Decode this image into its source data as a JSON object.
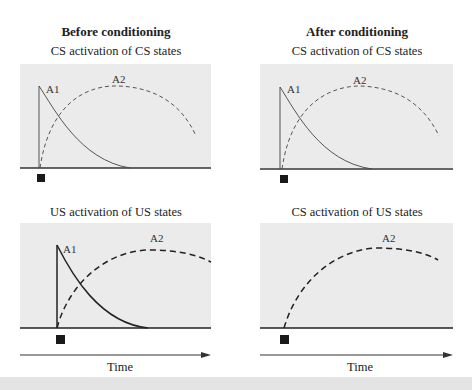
{
  "columns": [
    {
      "title": "Before conditioning"
    },
    {
      "title": "After conditioning"
    }
  ],
  "panels": [
    {
      "id": "before-top",
      "subtitle": "CS activation of CS states",
      "curves": [
        "A1",
        "A2"
      ]
    },
    {
      "id": "after-top",
      "subtitle": "CS activation of CS states",
      "curves": [
        "A1",
        "A2"
      ]
    },
    {
      "id": "before-bottom",
      "subtitle": "US activation of US states",
      "curves": [
        "A1",
        "A2"
      ]
    },
    {
      "id": "after-bottom",
      "subtitle": "CS activation of US states",
      "curves": [
        "A2"
      ]
    }
  ],
  "labels": {
    "a1": "A1",
    "a2": "A2"
  },
  "axis": {
    "time_label": "Time"
  },
  "colors": {
    "panel_bg": "#ebebeb",
    "line": "#333333",
    "stimulus_marker": "#1a1a1a"
  }
}
